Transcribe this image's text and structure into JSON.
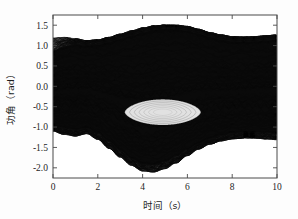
{
  "figure": {
    "background_color": "#fdfdfd",
    "frame_color": "#4a4a4a",
    "ink_color": "#0a0a0a"
  },
  "chart_data": {
    "type": "line",
    "title": "",
    "subtitle": "",
    "xlabel": "时间（s）",
    "ylabel": "功角（rad）",
    "xlim": [
      0,
      10
    ],
    "ylim": [
      -2.25,
      1.75
    ],
    "grid": false,
    "legend": null,
    "legend_position": "none",
    "xticks": [
      0,
      2,
      4,
      6,
      8,
      10
    ],
    "xtick_labels": [
      "0",
      "2",
      "4",
      "6",
      "8",
      "10"
    ],
    "yticks": [
      1.5,
      1.0,
      0.5,
      0.0,
      -0.5,
      -1.0,
      -1.5,
      -2.0
    ],
    "ytick_labels": [
      "1.5",
      "1.0",
      "0.5",
      "0.0",
      "-0.5",
      "-1.0",
      "-1.5",
      "-2.0"
    ],
    "series": [
      {
        "name": "upper_envelope",
        "x": [
          0.0,
          0.5,
          1.0,
          1.5,
          2.0,
          2.5,
          3.0,
          3.5,
          4.0,
          4.5,
          5.0,
          5.5,
          6.0,
          6.5,
          7.0,
          7.5,
          8.0,
          8.5,
          9.0,
          9.5,
          10.0
        ],
        "values": [
          1.18,
          1.2,
          1.17,
          1.12,
          1.14,
          1.2,
          1.28,
          1.36,
          1.43,
          1.48,
          1.5,
          1.5,
          1.47,
          1.4,
          1.32,
          1.26,
          1.22,
          1.21,
          1.22,
          1.24,
          1.26
        ]
      },
      {
        "name": "upper_band_inner",
        "x": [
          0.0,
          0.5,
          1.0,
          1.5,
          2.0,
          2.5,
          3.0,
          3.5,
          4.0,
          4.5,
          5.0,
          5.5,
          6.0,
          6.5,
          7.0,
          7.5,
          8.0,
          8.5,
          9.0,
          9.5,
          10.0
        ],
        "values": [
          0.86,
          0.96,
          1.02,
          1.0,
          1.02,
          1.08,
          1.16,
          1.24,
          1.32,
          1.38,
          1.41,
          1.4,
          1.36,
          1.29,
          1.21,
          1.14,
          1.1,
          1.09,
          1.1,
          1.12,
          1.14
        ]
      },
      {
        "name": "lower_envelope",
        "x": [
          0.0,
          0.5,
          1.0,
          1.5,
          2.0,
          2.5,
          3.0,
          3.5,
          4.0,
          4.5,
          5.0,
          5.5,
          6.0,
          6.5,
          7.0,
          7.5,
          8.0,
          8.5,
          9.0,
          9.5,
          10.0
        ],
        "values": [
          -1.1,
          -1.18,
          -1.22,
          -1.16,
          -1.3,
          -1.52,
          -1.74,
          -1.94,
          -2.08,
          -2.1,
          -2.02,
          -1.88,
          -1.7,
          -1.54,
          -1.42,
          -1.34,
          -1.29,
          -1.27,
          -1.27,
          -1.29,
          -1.31
        ]
      },
      {
        "name": "lower_band_inner",
        "x": [
          0.0,
          0.5,
          1.0,
          1.5,
          2.0,
          2.5,
          3.0,
          3.5,
          4.0,
          4.5,
          5.0,
          5.5,
          6.0,
          6.5,
          7.0,
          7.5,
          8.0,
          8.5,
          9.0,
          9.5,
          10.0
        ],
        "values": [
          -0.96,
          -1.02,
          -1.06,
          -1.02,
          -1.14,
          -1.34,
          -1.56,
          -1.76,
          -1.9,
          -1.92,
          -1.84,
          -1.7,
          -1.54,
          -1.4,
          -1.28,
          -1.2,
          -1.14,
          -1.12,
          -1.12,
          -1.13,
          -1.15
        ]
      },
      {
        "name": "eye_void_center",
        "x": [
          5.0
        ],
        "values": [
          -0.62
        ]
      }
    ],
    "eye_void": {
      "x_start": 3.2,
      "x_end": 6.6,
      "y_top": -0.32,
      "y_bottom": -0.95,
      "note": "lens shaped light region of separated trajectories"
    }
  }
}
